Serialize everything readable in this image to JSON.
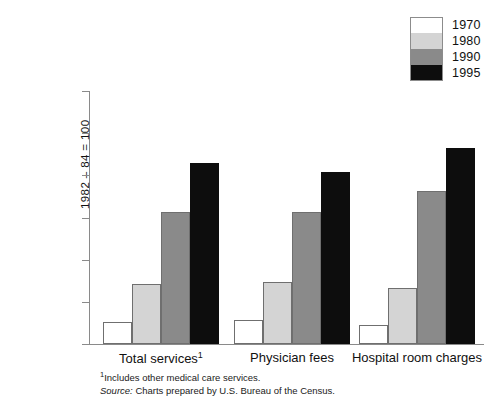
{
  "chart_data": {
    "type": "bar",
    "title": "",
    "subtitle": "",
    "xlabel": "",
    "ylabel": "1982 – 84 = 100",
    "categories": [
      "Total services¹",
      "Physician fees",
      "Hospital room charges"
    ],
    "series": [
      {
        "name": "1970",
        "values": [
          26,
          29,
          22
        ],
        "color": "#ffffff"
      },
      {
        "name": "1980",
        "values": [
          71,
          74,
          67
        ],
        "color": "#d4d4d4"
      },
      {
        "name": "1990",
        "values": [
          157,
          157,
          181
        ],
        "color": "#8a8a8a"
      },
      {
        "name": "1995",
        "values": [
          215,
          204,
          233
        ],
        "color": "#0d0d0d"
      }
    ],
    "ylim": [
      0,
      300
    ],
    "yticks": [
      0,
      50,
      100,
      150,
      200,
      250,
      300
    ],
    "ytick_labels": [
      "0",
      "50",
      "100",
      "150",
      "200",
      "250",
      "300"
    ],
    "grid": false,
    "legend_position": "top-right",
    "legend_entries": [
      "1970",
      "1980",
      "1990",
      "1995"
    ]
  },
  "axis": {
    "y_title": "1982 – 84 = 100",
    "tick_labels": [
      "300",
      "250",
      "200",
      "150",
      "100",
      "50",
      "0"
    ]
  },
  "categories": [
    {
      "label_main": "Total services",
      "label_sup": "1"
    },
    {
      "label_main": "Physician fees",
      "label_sup": ""
    },
    {
      "label_main": "Hospital room charges",
      "label_sup": ""
    }
  ],
  "legend": {
    "items": [
      {
        "label": "1970",
        "color": "#ffffff"
      },
      {
        "label": "1980",
        "color": "#d4d4d4"
      },
      {
        "label": "1990",
        "color": "#8a8a8a"
      },
      {
        "label": "1995",
        "color": "#0d0d0d"
      }
    ]
  },
  "footnotes": {
    "marker": "1",
    "line1": "Includes other medical care services.",
    "source_word": "Source:",
    "source_text": " Charts prepared by U.S. Bureau of the Census."
  }
}
